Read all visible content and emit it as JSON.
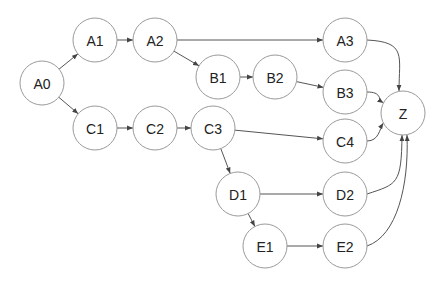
{
  "diagram": {
    "type": "directed-graph",
    "node_radius": 22,
    "colors": {
      "node_stroke": "#9a9a9a",
      "node_fill": "#ffffff",
      "edge": "#555555",
      "text": "#222222"
    },
    "nodes": [
      {
        "id": "A0",
        "label": "A0",
        "x": 42,
        "y": 83
      },
      {
        "id": "A1",
        "label": "A1",
        "x": 95,
        "y": 40
      },
      {
        "id": "A2",
        "label": "A2",
        "x": 155,
        "y": 40
      },
      {
        "id": "A3",
        "label": "A3",
        "x": 345,
        "y": 40
      },
      {
        "id": "B1",
        "label": "B1",
        "x": 218,
        "y": 77
      },
      {
        "id": "B2",
        "label": "B2",
        "x": 275,
        "y": 77
      },
      {
        "id": "B3",
        "label": "B3",
        "x": 345,
        "y": 92
      },
      {
        "id": "C1",
        "label": "C1",
        "x": 95,
        "y": 128
      },
      {
        "id": "C2",
        "label": "C2",
        "x": 155,
        "y": 128
      },
      {
        "id": "C3",
        "label": "C3",
        "x": 213,
        "y": 128
      },
      {
        "id": "C4",
        "label": "C4",
        "x": 345,
        "y": 141
      },
      {
        "id": "D1",
        "label": "D1",
        "x": 238,
        "y": 194
      },
      {
        "id": "D2",
        "label": "D2",
        "x": 345,
        "y": 194
      },
      {
        "id": "E1",
        "label": "E1",
        "x": 265,
        "y": 246
      },
      {
        "id": "E2",
        "label": "E2",
        "x": 345,
        "y": 246
      },
      {
        "id": "Z",
        "label": "Z",
        "x": 403,
        "y": 113
      }
    ],
    "edges": [
      {
        "from": "A0",
        "to": "A1",
        "curve": false
      },
      {
        "from": "A0",
        "to": "C1",
        "curve": false
      },
      {
        "from": "A1",
        "to": "A2",
        "curve": false
      },
      {
        "from": "A2",
        "to": "A3",
        "curve": false
      },
      {
        "from": "A2",
        "to": "B1",
        "curve": false
      },
      {
        "from": "B1",
        "to": "B2",
        "curve": false
      },
      {
        "from": "B2",
        "to": "B3",
        "curve": false
      },
      {
        "from": "C1",
        "to": "C2",
        "curve": false
      },
      {
        "from": "C2",
        "to": "C3",
        "curve": false
      },
      {
        "from": "C3",
        "to": "C4",
        "curve": false
      },
      {
        "from": "C3",
        "to": "D1",
        "curve": false
      },
      {
        "from": "D1",
        "to": "D2",
        "curve": false
      },
      {
        "from": "D1",
        "to": "E1",
        "curve": false
      },
      {
        "from": "E1",
        "to": "E2",
        "curve": false
      },
      {
        "from": "A3",
        "to": "Z",
        "curve": true
      },
      {
        "from": "B3",
        "to": "Z",
        "curve": true
      },
      {
        "from": "C4",
        "to": "Z",
        "curve": true
      },
      {
        "from": "D2",
        "to": "Z",
        "curve": true
      },
      {
        "from": "E2",
        "to": "Z",
        "curve": true
      }
    ]
  }
}
